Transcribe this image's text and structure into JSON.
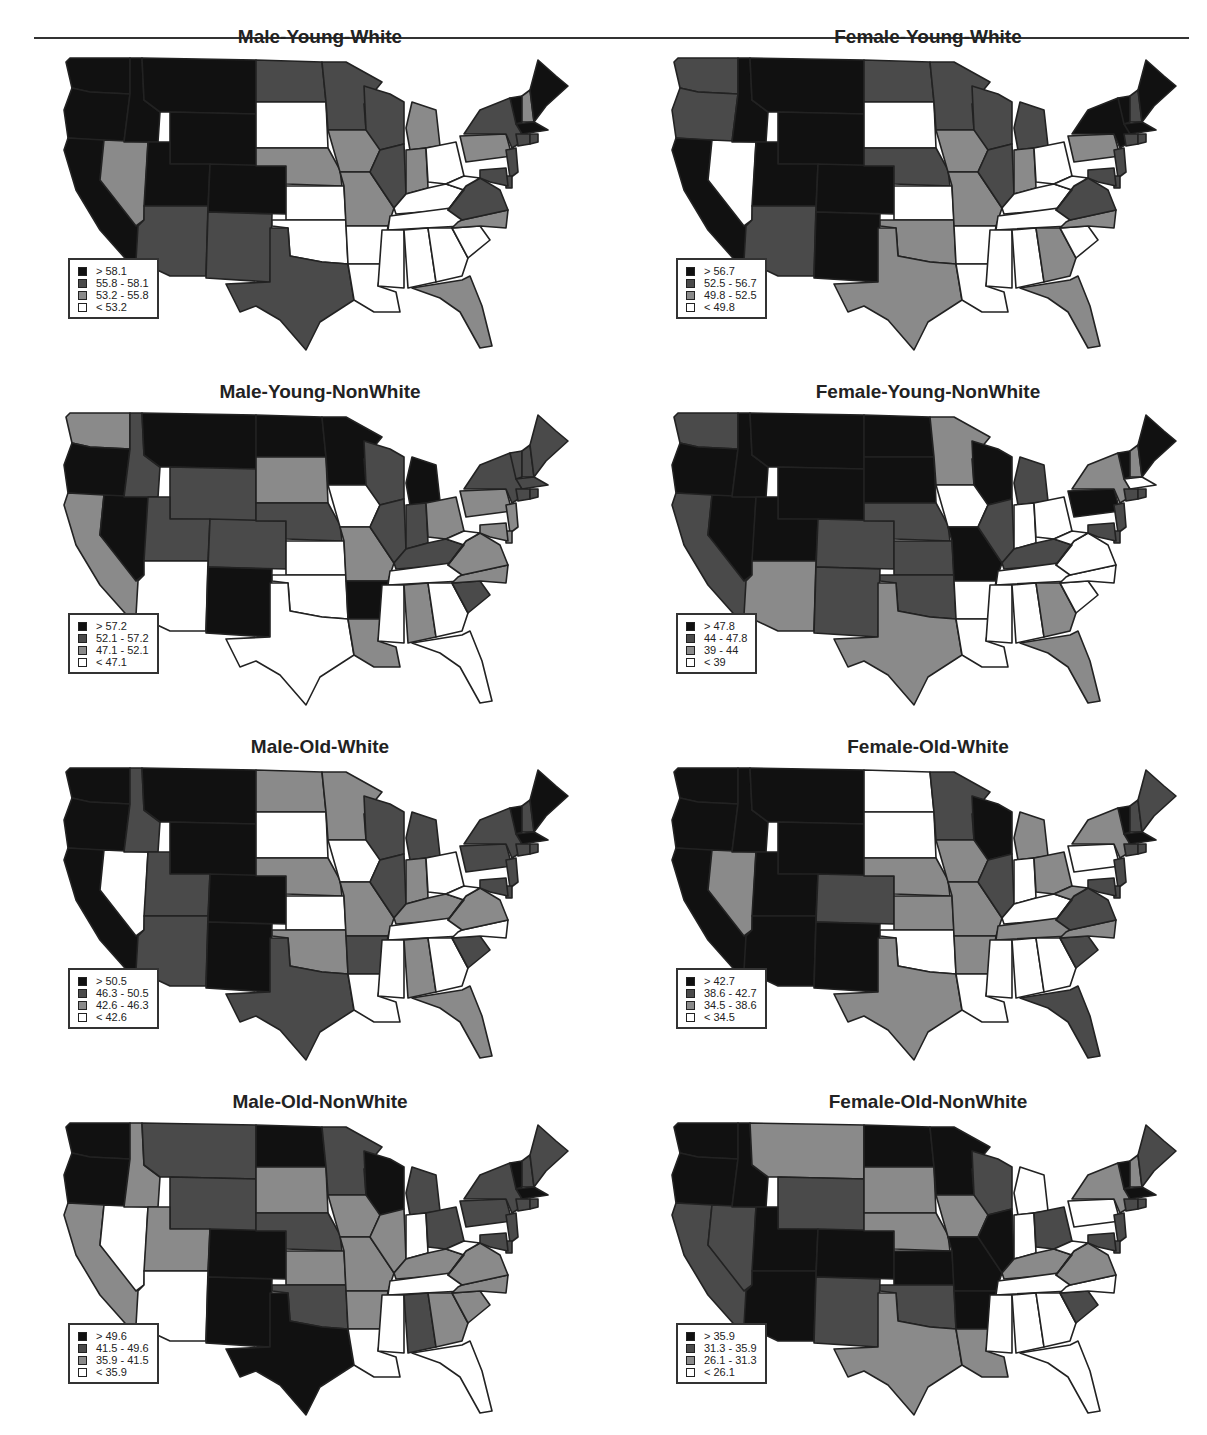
{
  "chart_data": [
    {
      "type": "choropleth-map",
      "title": "Male-Young-White",
      "legend": [
        "> 58.1",
        "55.8 - 58.1",
        "53.2 - 55.8",
        "< 53.2"
      ],
      "breaks": [
        53.2,
        55.8,
        58.1
      ],
      "states": {
        "WA": 3,
        "OR": 3,
        "CA": 3,
        "ID": 3,
        "MT": 3,
        "WY": 3,
        "NV": 1,
        "UT": 3,
        "CO": 3,
        "AZ": 2,
        "NM": 2,
        "ND": 2,
        "SD": 0,
        "NE": 1,
        "KS": 0,
        "OK": 0,
        "TX": 2,
        "MN": 2,
        "IA": 1,
        "MO": 1,
        "AR": 0,
        "LA": 0,
        "WI": 2,
        "IL": 2,
        "MI": 1,
        "IN": 1,
        "OH": 0,
        "KY": 0,
        "TN": 0,
        "MS": 0,
        "AL": 0,
        "GA": 0,
        "FL": 1,
        "SC": 0,
        "NC": 1,
        "VA": 2,
        "WV": 0,
        "PA": 1,
        "NY": 2,
        "VT": 3,
        "NH": 1,
        "ME": 3,
        "MA": 3,
        "CT": 2,
        "RI": 2,
        "NJ": 2,
        "DE": 2,
        "MD": 2
      }
    },
    {
      "type": "choropleth-map",
      "title": "Female-Young-White",
      "legend": [
        "> 56.7",
        "52.5 - 56.7",
        "49.8 - 52.5",
        "< 49.8"
      ],
      "breaks": [
        49.8,
        52.5,
        56.7
      ],
      "states": {
        "WA": 2,
        "OR": 2,
        "CA": 3,
        "ID": 3,
        "MT": 3,
        "WY": 3,
        "NV": 0,
        "UT": 3,
        "CO": 3,
        "AZ": 2,
        "NM": 3,
        "ND": 2,
        "SD": 0,
        "NE": 2,
        "KS": 0,
        "OK": 1,
        "TX": 1,
        "MN": 2,
        "IA": 1,
        "MO": 1,
        "AR": 0,
        "LA": 0,
        "WI": 2,
        "IL": 2,
        "MI": 2,
        "IN": 1,
        "OH": 0,
        "KY": 0,
        "TN": 0,
        "MS": 0,
        "AL": 0,
        "GA": 1,
        "FL": 1,
        "SC": 0,
        "NC": 1,
        "VA": 2,
        "WV": 0,
        "PA": 1,
        "NY": 3,
        "VT": 3,
        "NH": 2,
        "ME": 3,
        "MA": 3,
        "CT": 2,
        "RI": 2,
        "NJ": 2,
        "DE": 2,
        "MD": 2
      }
    },
    {
      "type": "choropleth-map",
      "title": "Male-Young-NonWhite",
      "legend": [
        "> 57.2",
        "52.1 - 57.2",
        "47.1 - 52.1",
        "< 47.1"
      ],
      "breaks": [
        47.1,
        52.1,
        57.2
      ],
      "states": {
        "WA": 1,
        "OR": 3,
        "CA": 1,
        "ID": 2,
        "MT": 3,
        "WY": 2,
        "NV": 3,
        "UT": 2,
        "CO": 2,
        "AZ": 0,
        "NM": 3,
        "ND": 3,
        "SD": 1,
        "NE": 2,
        "KS": 0,
        "OK": 0,
        "TX": 0,
        "MN": 3,
        "IA": 0,
        "MO": 1,
        "AR": 3,
        "LA": 1,
        "WI": 2,
        "IL": 2,
        "MI": 3,
        "IN": 2,
        "OH": 1,
        "KY": 2,
        "TN": 0,
        "MS": 0,
        "AL": 1,
        "GA": 0,
        "FL": 0,
        "SC": 2,
        "NC": 1,
        "VA": 1,
        "WV": 0,
        "PA": 1,
        "NY": 2,
        "VT": 2,
        "NH": 2,
        "ME": 2,
        "MA": 2,
        "CT": 2,
        "RI": 2,
        "NJ": 1,
        "DE": 1,
        "MD": 1
      }
    },
    {
      "type": "choropleth-map",
      "title": "Female-Young-NonWhite",
      "legend": [
        "> 47.8",
        "44 - 47.8",
        "39 - 44",
        "< 39"
      ],
      "breaks": [
        39,
        44,
        47.8
      ],
      "states": {
        "WA": 2,
        "OR": 3,
        "CA": 2,
        "ID": 3,
        "MT": 3,
        "WY": 3,
        "NV": 3,
        "UT": 3,
        "CO": 2,
        "AZ": 1,
        "NM": 2,
        "ND": 3,
        "SD": 3,
        "NE": 2,
        "KS": 2,
        "OK": 2,
        "TX": 1,
        "MN": 1,
        "IA": 0,
        "MO": 3,
        "AR": 0,
        "LA": 0,
        "WI": 3,
        "IL": 2,
        "MI": 2,
        "IN": 0,
        "OH": 0,
        "KY": 2,
        "TN": 0,
        "MS": 0,
        "AL": 0,
        "GA": 1,
        "FL": 1,
        "SC": 0,
        "NC": 0,
        "VA": 0,
        "WV": 0,
        "PA": 3,
        "NY": 1,
        "VT": 3,
        "NH": 1,
        "ME": 3,
        "MA": 0,
        "CT": 2,
        "RI": 2,
        "NJ": 2,
        "DE": 2,
        "MD": 2
      }
    },
    {
      "type": "choropleth-map",
      "title": "Male-Old-White",
      "legend": [
        "> 50.5",
        "46.3 - 50.5",
        "42.6 - 46.3",
        "< 42.6"
      ],
      "breaks": [
        42.6,
        46.3,
        50.5
      ],
      "states": {
        "WA": 3,
        "OR": 3,
        "CA": 3,
        "ID": 2,
        "MT": 3,
        "WY": 3,
        "NV": 0,
        "UT": 2,
        "CO": 3,
        "AZ": 2,
        "NM": 3,
        "ND": 1,
        "SD": 0,
        "NE": 1,
        "KS": 0,
        "OK": 1,
        "TX": 2,
        "MN": 1,
        "IA": 0,
        "MO": 1,
        "AR": 2,
        "LA": 0,
        "WI": 2,
        "IL": 2,
        "MI": 2,
        "IN": 1,
        "OH": 0,
        "KY": 1,
        "TN": 0,
        "MS": 0,
        "AL": 1,
        "GA": 0,
        "FL": 1,
        "SC": 2,
        "NC": 0,
        "VA": 1,
        "WV": 0,
        "PA": 2,
        "NY": 2,
        "VT": 3,
        "NH": 2,
        "ME": 3,
        "MA": 3,
        "CT": 2,
        "RI": 2,
        "NJ": 2,
        "DE": 2,
        "MD": 2
      }
    },
    {
      "type": "choropleth-map",
      "title": "Female-Old-White",
      "legend": [
        "> 42.7",
        "38.6 - 42.7",
        "34.5 - 38.6",
        "< 34.5"
      ],
      "breaks": [
        34.5,
        38.6,
        42.7
      ],
      "states": {
        "WA": 3,
        "OR": 3,
        "CA": 3,
        "ID": 3,
        "MT": 3,
        "WY": 3,
        "NV": 1,
        "UT": 3,
        "CO": 2,
        "AZ": 3,
        "NM": 3,
        "ND": 0,
        "SD": 0,
        "NE": 1,
        "KS": 1,
        "OK": 0,
        "TX": 1,
        "MN": 2,
        "IA": 1,
        "MO": 1,
        "AR": 1,
        "LA": 0,
        "WI": 3,
        "IL": 2,
        "MI": 1,
        "IN": 0,
        "OH": 1,
        "KY": 0,
        "TN": 1,
        "MS": 0,
        "AL": 0,
        "GA": 0,
        "FL": 2,
        "SC": 2,
        "NC": 1,
        "VA": 2,
        "WV": 1,
        "PA": 0,
        "NY": 1,
        "VT": 3,
        "NH": 2,
        "ME": 2,
        "MA": 3,
        "CT": 2,
        "RI": 2,
        "NJ": 2,
        "DE": 2,
        "MD": 2
      }
    },
    {
      "type": "choropleth-map",
      "title": "Male-Old-NonWhite",
      "legend": [
        "> 49.6",
        "41.5 - 49.6",
        "35.9 - 41.5",
        "< 35.9"
      ],
      "breaks": [
        35.9,
        41.5,
        49.6
      ],
      "states": {
        "WA": 3,
        "OR": 3,
        "CA": 1,
        "ID": 1,
        "MT": 2,
        "WY": 2,
        "NV": 0,
        "UT": 1,
        "CO": 3,
        "AZ": 0,
        "NM": 3,
        "ND": 3,
        "SD": 1,
        "NE": 2,
        "KS": 1,
        "OK": 2,
        "TX": 3,
        "MN": 2,
        "IA": 1,
        "MO": 1,
        "AR": 1,
        "LA": 0,
        "WI": 3,
        "IL": 1,
        "MI": 2,
        "IN": 0,
        "OH": 2,
        "KY": 1,
        "TN": 0,
        "MS": 0,
        "AL": 2,
        "GA": 1,
        "FL": 0,
        "SC": 1,
        "NC": 1,
        "VA": 1,
        "WV": 0,
        "PA": 2,
        "NY": 2,
        "VT": 3,
        "NH": 2,
        "ME": 2,
        "MA": 3,
        "CT": 2,
        "RI": 2,
        "NJ": 2,
        "DE": 2,
        "MD": 2
      }
    },
    {
      "type": "choropleth-map",
      "title": "Female-Old-NonWhite",
      "legend": [
        "> 35.9",
        "31.3 - 35.9",
        "26.1 - 31.3",
        "< 26.1"
      ],
      "breaks": [
        26.1,
        31.3,
        35.9
      ],
      "states": {
        "WA": 3,
        "OR": 3,
        "CA": 2,
        "ID": 3,
        "MT": 1,
        "WY": 2,
        "NV": 2,
        "UT": 3,
        "CO": 3,
        "AZ": 3,
        "NM": 2,
        "ND": 3,
        "SD": 1,
        "NE": 1,
        "KS": 3,
        "OK": 2,
        "TX": 1,
        "MN": 3,
        "IA": 1,
        "MO": 3,
        "AR": 3,
        "LA": 1,
        "WI": 2,
        "IL": 3,
        "MI": 0,
        "IN": 0,
        "OH": 2,
        "KY": 1,
        "TN": 0,
        "MS": 0,
        "AL": 0,
        "GA": 0,
        "FL": 0,
        "SC": 2,
        "NC": 0,
        "VA": 1,
        "WV": 0,
        "PA": 0,
        "NY": 1,
        "VT": 3,
        "NH": 1,
        "ME": 2,
        "MA": 3,
        "CT": 2,
        "RI": 2,
        "NJ": 2,
        "DE": 2,
        "MD": 2
      }
    }
  ],
  "fill_colors": [
    "#ffffff",
    "#8a8a8a",
    "#4a4a4a",
    "#111111"
  ],
  "border_color": "#222222"
}
